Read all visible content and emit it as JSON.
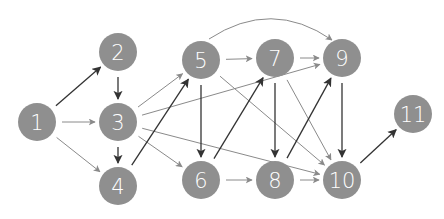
{
  "diagram": {
    "type": "directed-graph",
    "colors": {
      "node_fill": "#8f8f8f",
      "node_text": "#ffffff",
      "edge_dark": "#333333",
      "edge_gray": "#8a8a8a",
      "background": "#ffffff"
    },
    "node_radius": 19,
    "nodes": [
      {
        "id": "1",
        "label": "1",
        "x": 37,
        "y": 122
      },
      {
        "id": "2",
        "label": "2",
        "x": 118,
        "y": 52
      },
      {
        "id": "3",
        "label": "3",
        "x": 118,
        "y": 122
      },
      {
        "id": "4",
        "label": "4",
        "x": 118,
        "y": 186
      },
      {
        "id": "5",
        "label": "5",
        "x": 201,
        "y": 60
      },
      {
        "id": "6",
        "label": "6",
        "x": 201,
        "y": 180
      },
      {
        "id": "7",
        "label": "7",
        "x": 275,
        "y": 58
      },
      {
        "id": "8",
        "label": "8",
        "x": 275,
        "y": 180
      },
      {
        "id": "9",
        "label": "9",
        "x": 342,
        "y": 58
      },
      {
        "id": "10",
        "label": "10",
        "x": 342,
        "y": 180
      },
      {
        "id": "11",
        "label": "11",
        "x": 413,
        "y": 114
      }
    ],
    "edges": [
      {
        "from": "1",
        "to": "2",
        "style": "dark"
      },
      {
        "from": "1",
        "to": "3",
        "style": "gray"
      },
      {
        "from": "1",
        "to": "4",
        "style": "gray"
      },
      {
        "from": "2",
        "to": "3",
        "style": "dark"
      },
      {
        "from": "3",
        "to": "4",
        "style": "dark"
      },
      {
        "from": "3",
        "to": "5",
        "style": "gray"
      },
      {
        "from": "3",
        "to": "6",
        "style": "gray"
      },
      {
        "from": "3",
        "to": "9",
        "style": "gray"
      },
      {
        "from": "3",
        "to": "10",
        "style": "gray"
      },
      {
        "from": "4",
        "to": "5",
        "style": "dark"
      },
      {
        "from": "5",
        "to": "6",
        "style": "dark"
      },
      {
        "from": "5",
        "to": "7",
        "style": "gray"
      },
      {
        "from": "5",
        "to": "9",
        "style": "gray",
        "curved": true
      },
      {
        "from": "5",
        "to": "10",
        "style": "gray"
      },
      {
        "from": "6",
        "to": "7",
        "style": "dark"
      },
      {
        "from": "6",
        "to": "8",
        "style": "gray"
      },
      {
        "from": "7",
        "to": "8",
        "style": "dark"
      },
      {
        "from": "7",
        "to": "9",
        "style": "gray"
      },
      {
        "from": "7",
        "to": "10",
        "style": "gray"
      },
      {
        "from": "8",
        "to": "9",
        "style": "dark"
      },
      {
        "from": "8",
        "to": "10",
        "style": "gray"
      },
      {
        "from": "9",
        "to": "10",
        "style": "dark"
      },
      {
        "from": "10",
        "to": "11",
        "style": "dark"
      }
    ]
  }
}
